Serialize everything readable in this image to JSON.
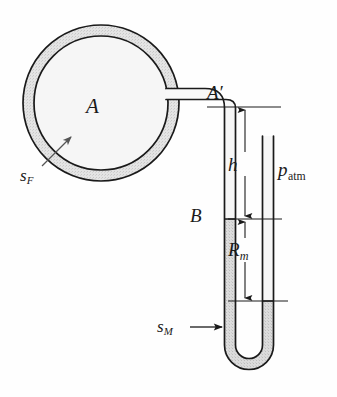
{
  "figure": {
    "type": "engineering-diagram",
    "canvas": {
      "width": 337,
      "height": 397
    },
    "colors": {
      "ink": "#1a1a1a",
      "vessel_wall_fill": "#e2e2e2",
      "vessel_interior_fill": "#f4f4f4",
      "manometer_fluid_fill": "#d9d9d9",
      "tube_interior_fill": "#f5f5f5",
      "background": "#fefefe"
    },
    "labels": {
      "vessel": "A",
      "vessel_tap": "A",
      "vessel_tap_prime": "′",
      "height_h": "h",
      "atmospheric_pressure": "p",
      "atmospheric_pressure_sub": "atm",
      "point_B": "B",
      "manometer_reading": "R",
      "manometer_reading_sub": "m",
      "vessel_fluid": "s",
      "vessel_fluid_sub": "F",
      "manometer_fluid": "s",
      "manometer_fluid_sub": "M"
    },
    "dimensions": [
      {
        "name": "h",
        "from": "A'",
        "to": "B",
        "label": "h"
      },
      {
        "name": "R_m",
        "from": "B",
        "to": "mercury-level",
        "label": "R_m"
      }
    ],
    "levels": {
      "A_prime_y": 107,
      "B_y": 219,
      "right_leg_meniscus_y": 301
    }
  }
}
